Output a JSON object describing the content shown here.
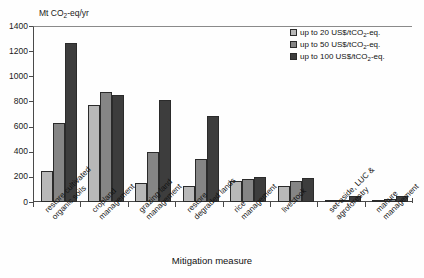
{
  "chart_data": {
    "type": "bar",
    "title": "",
    "ylabel": "Mt CO2-eq/yr",
    "ylabel_prefix": "Mt CO",
    "ylabel_sub": "2",
    "ylabel_suffix": "-eq/yr",
    "xlabel": "Mitigation measure",
    "ylim": [
      0,
      1400
    ],
    "yticks": [
      0,
      200,
      400,
      600,
      800,
      1000,
      1200,
      1400
    ],
    "grid": false,
    "legend_position": "top-right",
    "categories": [
      "restore cultivated organic soils",
      "cropland management",
      "grazing land management",
      "restore degraded lands",
      "rice management",
      "livestock",
      "set-aside, LUC & agroforestry",
      "manure management"
    ],
    "category_lines": [
      [
        "restore cultivated",
        "organic soils"
      ],
      [
        "cropland",
        "management"
      ],
      [
        "grazing land",
        "management"
      ],
      [
        "restore",
        "degraded lands"
      ],
      [
        "rice",
        "management"
      ],
      [
        "livestock"
      ],
      [
        "set-aside, LUC &",
        "agroforestry"
      ],
      [
        "manure",
        "management"
      ]
    ],
    "series": [
      {
        "name": "up to 20 US$/tCO2-eq.",
        "name_prefix": "up to 20 US$/tCO",
        "name_sub": "2",
        "name_suffix": "-eq.",
        "color": "#b8b8b8",
        "values": [
          245,
          770,
          155,
          130,
          165,
          125,
          5,
          8
        ]
      },
      {
        "name": "up to 50 US$/tCO2-eq.",
        "name_prefix": "up to 50 US$/tCO",
        "name_sub": "2",
        "name_suffix": "-eq.",
        "color": "#858585",
        "values": [
          630,
          875,
          400,
          345,
          180,
          165,
          20,
          25
        ]
      },
      {
        "name": "up to 100 US$/tCO2-eq.",
        "name_prefix": "up to 100 US$/tCO",
        "name_sub": "2",
        "name_suffix": "-eq.",
        "color": "#3d3d3d",
        "values": [
          1265,
          855,
          815,
          685,
          200,
          195,
          45,
          45
        ]
      }
    ]
  }
}
